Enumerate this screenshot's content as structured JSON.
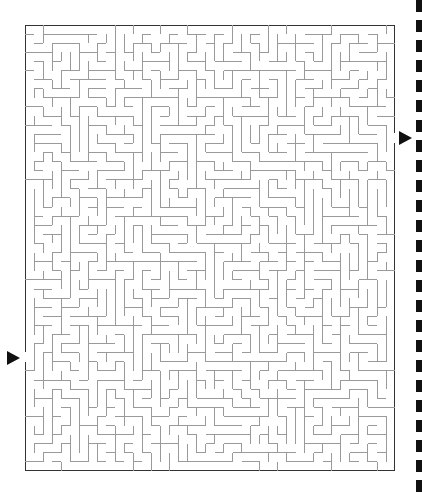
{
  "puzzle": {
    "type": "maze",
    "cols": 41,
    "rows": 49,
    "cell_px": 9,
    "wall_color": "#9a9a9a",
    "border_color": "#333333",
    "entry": {
      "side": "left",
      "row": 37,
      "marker": "triangle-right"
    },
    "exit": {
      "side": "right",
      "row": 12,
      "marker": "triangle-right"
    }
  },
  "decoration": {
    "edge_strip": "dashed-black-right-edge"
  }
}
